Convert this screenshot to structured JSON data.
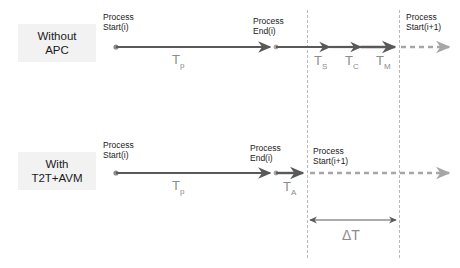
{
  "diagram": {
    "background_color": "#ffffff",
    "solid_line_color": "#595959",
    "dashed_line_color": "#a6a6a6",
    "guide_line_color": "#b9b9b9",
    "label_box_color": "#f2f2f2",
    "duration_text_color": "#8c8c8c",
    "node_text_color": "#1a1a1a"
  },
  "rows": [
    {
      "id": "without-apc",
      "label_line1": "Without",
      "label_line2": "APC",
      "nodes": [
        {
          "id": "start-i",
          "line1": "Process",
          "line2": "Start(i)"
        },
        {
          "id": "end-i",
          "line1": "Process",
          "line2": "End(i)"
        },
        {
          "id": "start-i1",
          "line1": "Process",
          "line2": "Start(i+1)"
        }
      ],
      "durations": [
        {
          "id": "tp",
          "base": "T",
          "sub": "p"
        },
        {
          "id": "ts",
          "base": "T",
          "sub": "S"
        },
        {
          "id": "tc",
          "base": "T",
          "sub": "C"
        },
        {
          "id": "tm",
          "base": "T",
          "sub": "M"
        }
      ]
    },
    {
      "id": "with-t2t-avm",
      "label_line1": "With",
      "label_line2": "T2T+AVM",
      "nodes": [
        {
          "id": "start-i",
          "line1": "Process",
          "line2": "Start(i)"
        },
        {
          "id": "end-i",
          "line1": "Process",
          "line2": "End(i)"
        },
        {
          "id": "start-i1",
          "line1": "Process",
          "line2": "Start(i+1)"
        }
      ],
      "durations": [
        {
          "id": "tp",
          "base": "T",
          "sub": "p"
        },
        {
          "id": "ta",
          "base": "T",
          "sub": "A"
        }
      ]
    }
  ],
  "delta": {
    "id": "delta-t",
    "label": "ΔT"
  }
}
